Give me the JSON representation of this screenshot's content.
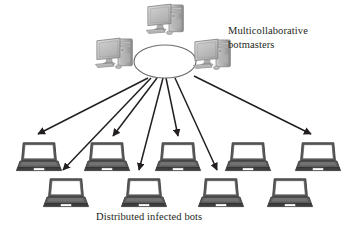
{
  "diagram": {
    "background_color": "#ffffff",
    "width": 351,
    "height": 236,
    "labels": {
      "botmasters": "Multicollaborative\nbotmasters",
      "bots": "Distributed infected bots"
    },
    "colors": {
      "line": "#231f20",
      "text": "#231f20",
      "device_light": "#d6d6d6",
      "device_mid": "#a8a8a8",
      "device_dark": "#6e6e6e",
      "laptop_base": "#4d4d4d",
      "laptop_screen": "#ffffff",
      "ellipse_fill": "#ffffff",
      "ellipse_stroke": "#6e6e6e"
    },
    "ellipse": {
      "name": "command-and-control-cloud",
      "cx": 165,
      "cy": 61,
      "rx": 31,
      "ry": 16.5
    },
    "botmasters": [
      {
        "name": "botmaster-top",
        "x": 146,
        "y": 2,
        "scale": 1.0
      },
      {
        "name": "botmaster-left",
        "x": 94,
        "y": 36,
        "scale": 1.0
      },
      {
        "name": "botmaster-right",
        "x": 192,
        "y": 37,
        "scale": 1.0
      }
    ],
    "bots": {
      "row_top_y": 142,
      "row_bottom_y": 178,
      "top_row": [
        {
          "name": "bot-1",
          "x": 18
        },
        {
          "name": "bot-2",
          "x": 85
        },
        {
          "name": "bot-3",
          "x": 156
        },
        {
          "name": "bot-4",
          "x": 226
        },
        {
          "name": "bot-5",
          "x": 296
        }
      ],
      "bottom_row": [
        {
          "name": "bot-6",
          "x": 44
        },
        {
          "name": "bot-7",
          "x": 122
        },
        {
          "name": "bot-8",
          "x": 200
        },
        {
          "name": "bot-9",
          "x": 268
        }
      ],
      "laptop_width": 44,
      "laptop_height": 30
    },
    "arrows": [
      {
        "name": "arrow-to-bot-1",
        "x1": 148,
        "y1": 78,
        "x2": 38,
        "y2": 136
      },
      {
        "name": "arrow-to-bot-2",
        "x1": 156,
        "y1": 78,
        "x2": 112,
        "y2": 138
      },
      {
        "name": "arrow-to-bot-6",
        "x1": 150,
        "y1": 78,
        "x2": 62,
        "y2": 172
      },
      {
        "name": "arrow-to-bot-3",
        "x1": 166,
        "y1": 78,
        "x2": 178,
        "y2": 138
      },
      {
        "name": "arrow-to-bot-7",
        "x1": 162,
        "y1": 78,
        "x2": 138,
        "y2": 172
      },
      {
        "name": "arrow-to-bot-8",
        "x1": 174,
        "y1": 78,
        "x2": 216,
        "y2": 172
      },
      {
        "name": "arrow-to-bot-5",
        "x1": 196,
        "y1": 76,
        "x2": 312,
        "y2": 136
      }
    ]
  }
}
